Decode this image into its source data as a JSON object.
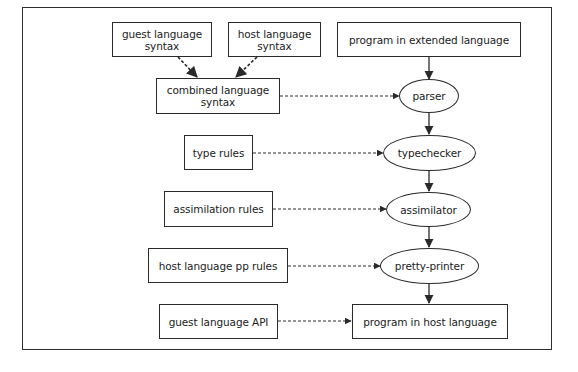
{
  "diagram": {
    "nodes": {
      "guest_syntax": {
        "label": "guest language\nsyntax",
        "shape": "box"
      },
      "host_syntax": {
        "label": "host language\nsyntax",
        "shape": "box"
      },
      "program_extended": {
        "label": "program in extended language",
        "shape": "box"
      },
      "combined_syntax": {
        "label": "combined language\nsyntax",
        "shape": "box"
      },
      "parser": {
        "label": "parser",
        "shape": "ellipse"
      },
      "type_rules": {
        "label": "type rules",
        "shape": "box"
      },
      "typechecker": {
        "label": "typechecker",
        "shape": "ellipse"
      },
      "assimilation_rules": {
        "label": "assimilation rules",
        "shape": "box"
      },
      "assimilator": {
        "label": "assimilator",
        "shape": "ellipse"
      },
      "host_pp_rules": {
        "label": "host language pp rules",
        "shape": "box"
      },
      "pretty_printer": {
        "label": "pretty-printer",
        "shape": "ellipse"
      },
      "guest_api": {
        "label": "guest language API",
        "shape": "box"
      },
      "program_host": {
        "label": "program in host language",
        "shape": "box"
      }
    },
    "edges": [
      {
        "from": "guest_syntax",
        "to": "combined_syntax",
        "style": "dashed"
      },
      {
        "from": "host_syntax",
        "to": "combined_syntax",
        "style": "dashed"
      },
      {
        "from": "program_extended",
        "to": "parser",
        "style": "solid"
      },
      {
        "from": "combined_syntax",
        "to": "parser",
        "style": "dashed"
      },
      {
        "from": "parser",
        "to": "typechecker",
        "style": "solid"
      },
      {
        "from": "type_rules",
        "to": "typechecker",
        "style": "dashed"
      },
      {
        "from": "typechecker",
        "to": "assimilator",
        "style": "solid"
      },
      {
        "from": "assimilation_rules",
        "to": "assimilator",
        "style": "dashed"
      },
      {
        "from": "assimilator",
        "to": "pretty_printer",
        "style": "solid"
      },
      {
        "from": "host_pp_rules",
        "to": "pretty_printer",
        "style": "dashed"
      },
      {
        "from": "pretty_printer",
        "to": "program_host",
        "style": "solid"
      },
      {
        "from": "guest_api",
        "to": "program_host",
        "style": "dashed"
      }
    ],
    "colors": {
      "stroke": "#2a2a2a",
      "text": "#222222",
      "background": "#ffffff"
    }
  }
}
